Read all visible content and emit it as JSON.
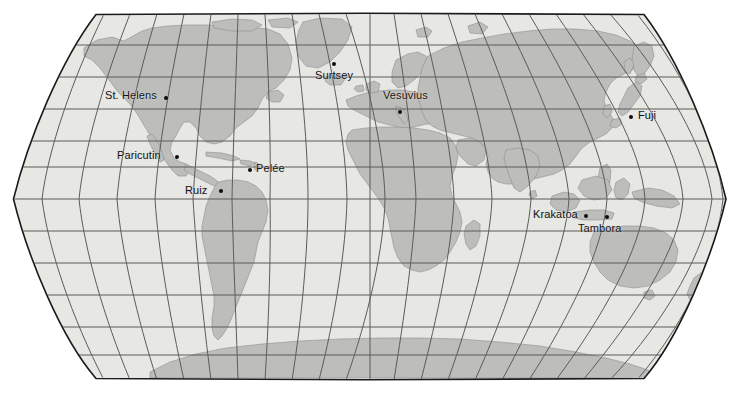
{
  "figure": {
    "projection": "Robinson",
    "background_color": "#ffffff",
    "ocean_color": "#e7e7e4",
    "land_color": "#bdbdbb",
    "graticule_color": "#5b5b59",
    "border_color": "#1a1a1a",
    "label_color": "#111111",
    "marker_color": "#0d0d0d",
    "ghost_text": "· · · · · · · · · · · · · · · · · · ·"
  },
  "graticule": {
    "meridian_interval_deg": 15,
    "parallel_interval_deg": 15,
    "visible": true
  },
  "volcanoes": [
    {
      "name": "St. Helens",
      "label_x": 105,
      "label_y": 90,
      "dot_x": 164,
      "dot_y": 96,
      "anchor": "left"
    },
    {
      "name": "Surtsey",
      "label_x": 315,
      "label_y": 70,
      "dot_x": 332,
      "dot_y": 62,
      "anchor": "left"
    },
    {
      "name": "Vesuvius",
      "label_x": 383,
      "label_y": 90,
      "dot_x": 398,
      "dot_y": 110,
      "anchor": "left"
    },
    {
      "name": "Fuji",
      "label_x": 638,
      "label_y": 110,
      "dot_x": 629,
      "dot_y": 115,
      "anchor": "left"
    },
    {
      "name": "Paricutin",
      "label_x": 117,
      "label_y": 150,
      "dot_x": 175,
      "dot_y": 155,
      "anchor": "left"
    },
    {
      "name": "Pelée",
      "label_x": 256,
      "label_y": 163,
      "dot_x": 248,
      "dot_y": 168,
      "anchor": "left"
    },
    {
      "name": "Ruiz",
      "label_x": 185,
      "label_y": 185,
      "dot_x": 219,
      "dot_y": 189,
      "anchor": "left"
    },
    {
      "name": "Krakatoa",
      "label_x": 533,
      "label_y": 209,
      "dot_x": 584,
      "dot_y": 214,
      "anchor": "left"
    },
    {
      "name": "Tambora",
      "label_x": 578,
      "label_y": 223,
      "dot_x": 605,
      "dot_y": 215,
      "anchor": "left"
    }
  ]
}
